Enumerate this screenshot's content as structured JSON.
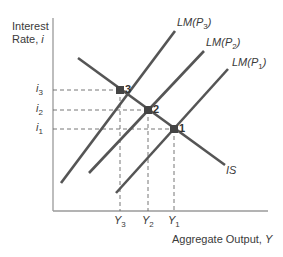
{
  "diagram": {
    "type": "IS-LM price level shift",
    "colors": {
      "axis": "#9a9a9a",
      "curve": "#555555",
      "dash": "#666666",
      "point": "#444444",
      "text": "#3a3a3a"
    },
    "y_axis": {
      "label_line1": "Interest",
      "label_line2": "Rate, ",
      "label_var": "i"
    },
    "x_axis": {
      "label": "Aggregate Output, ",
      "label_var": "Y"
    },
    "y_ticks": [
      {
        "var": "i",
        "sub": "3",
        "y": 90
      },
      {
        "var": "i",
        "sub": "2",
        "y": 110
      },
      {
        "var": "i",
        "sub": "1",
        "y": 129
      }
    ],
    "x_ticks": [
      {
        "var": "Y",
        "sub": "3",
        "x": 120
      },
      {
        "var": "Y",
        "sub": "2",
        "x": 148
      },
      {
        "var": "Y",
        "sub": "1",
        "x": 174
      }
    ],
    "curves": [
      {
        "name": "IS",
        "label": "IS",
        "x1": 78,
        "y1": 58,
        "x2": 225,
        "y2": 165
      },
      {
        "name": "LM(P3)",
        "label_main": "LM(P",
        "label_sub": "3",
        "label_end": ")",
        "x1": 61,
        "y1": 183,
        "x2": 175,
        "y2": 31
      },
      {
        "name": "LM(P2)",
        "label_main": "LM(P",
        "label_sub": "2",
        "label_end": ")",
        "x1": 89,
        "y1": 173,
        "x2": 204,
        "y2": 51
      },
      {
        "name": "LM(P1)",
        "label_main": "LM(P",
        "label_sub": "1",
        "label_end": ")",
        "x1": 116,
        "y1": 193,
        "x2": 228,
        "y2": 69
      }
    ],
    "equilibria": [
      {
        "label": "3",
        "x": 120,
        "y": 90
      },
      {
        "label": "2",
        "x": 148,
        "y": 110
      },
      {
        "label": "1",
        "x": 174,
        "y": 129
      }
    ]
  }
}
